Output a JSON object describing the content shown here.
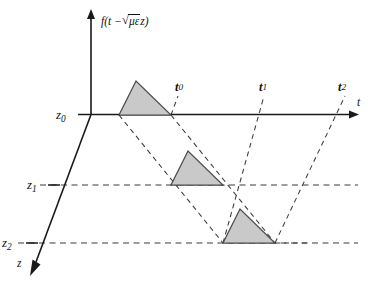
{
  "figure": {
    "background_color": "#ffffff",
    "pulse_fill_color": "#c9c9c9",
    "pulse_stroke_color": "#4a4a4a",
    "axis_color": "#1a1a1a",
    "dashed_color": "#3a3a3a"
  },
  "axes": {
    "vertical": {
      "name": "amplitude-axis",
      "label_prefix": "f",
      "label_open": "(",
      "label_t": "t",
      "label_minus": "−",
      "label_radical": "√",
      "label_under_radical": "με",
      "label_z": "z",
      "label_close": ")",
      "label_plain": "f(t − √με z)"
    },
    "horizontal": {
      "name": "time-axis",
      "label": "t"
    },
    "depth": {
      "name": "depth-axis",
      "label": "z"
    }
  },
  "depth_ticks": [
    {
      "id": "z0",
      "base": "z",
      "sub": "0",
      "value_label": "z₀"
    },
    {
      "id": "z1",
      "base": "z",
      "sub": "1",
      "value_label": "z₁"
    },
    {
      "id": "z2",
      "base": "z",
      "sub": "2",
      "value_label": "z₂"
    }
  ],
  "time_markers": [
    {
      "id": "t0",
      "base": "t",
      "sub": "0",
      "value_label": "t₀"
    },
    {
      "id": "t1",
      "base": "t",
      "sub": "1",
      "value_label": "t₁"
    },
    {
      "id": "t2",
      "base": "t",
      "sub": "2",
      "value_label": "t₂"
    }
  ],
  "pulses": [
    {
      "id": "pulse-z0",
      "at_depth": "z₀",
      "arrives_at": "t₀"
    },
    {
      "id": "pulse-z1",
      "at_depth": "z₁",
      "arrives_at": "t₁"
    },
    {
      "id": "pulse-z2",
      "at_depth": "z₂",
      "arrives_at": "t₂"
    }
  ]
}
